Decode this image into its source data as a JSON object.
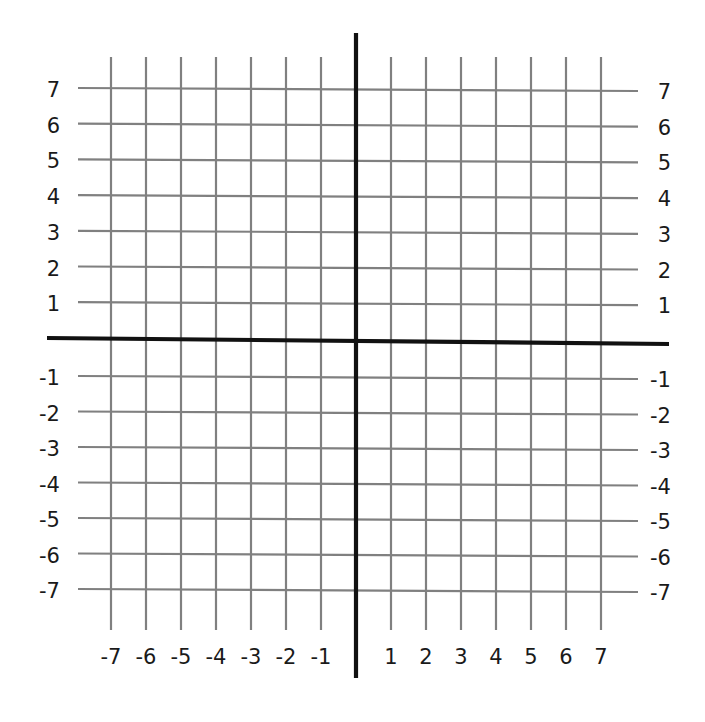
{
  "chart_data": {
    "type": "coordinate-grid",
    "title": "",
    "xlabel": "",
    "ylabel": "",
    "xlim": [
      -7,
      7
    ],
    "ylim": [
      -7,
      7
    ],
    "grid": true,
    "grid_step": 1,
    "x_ticks": [
      -7,
      -6,
      -5,
      -4,
      -3,
      -2,
      -1,
      1,
      2,
      3,
      4,
      5,
      6,
      7
    ],
    "y_ticks": [
      7,
      6,
      5,
      4,
      3,
      2,
      1,
      -1,
      -2,
      -3,
      -4,
      -5,
      -6,
      -7
    ],
    "x_tick_labels": [
      "-7",
      "-6",
      "-5",
      "-4",
      "-3",
      "-2",
      "-1",
      "1",
      "2",
      "3",
      "4",
      "5",
      "6",
      "7"
    ],
    "y_tick_labels_left": [
      "7",
      "6",
      "5",
      "4",
      "3",
      "2",
      "1",
      "-1",
      "-2",
      "-3",
      "-4",
      "-5",
      "-6",
      "-7"
    ],
    "y_tick_labels_right": [
      "7",
      "6",
      "5",
      "4",
      "3",
      "2",
      "1",
      "-1",
      "-2",
      "-3",
      "-4",
      "-5",
      "-6",
      "-7"
    ],
    "series": []
  },
  "colors": {
    "background": "#ffffff",
    "grid": "#808080",
    "axes": "#111111",
    "labels": "#1a1a1a"
  }
}
